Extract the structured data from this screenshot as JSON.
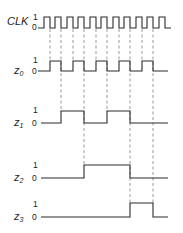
{
  "diagram": {
    "type": "timing-diagram",
    "signals": [
      {
        "name": "CLK",
        "label_main": "CLK",
        "label_sub": "",
        "level_high": "1",
        "level_low": "0"
      },
      {
        "name": "z0",
        "label_main": "z",
        "label_sub": "0",
        "level_high": "1",
        "level_low": "0"
      },
      {
        "name": "z1",
        "label_main": "z",
        "label_sub": "1",
        "level_high": "1",
        "level_low": "0"
      },
      {
        "name": "z2",
        "label_main": "z",
        "label_sub": "2",
        "level_high": "1",
        "level_low": "0"
      },
      {
        "name": "z3",
        "label_main": "z",
        "label_sub": "3",
        "level_high": "1",
        "level_low": "0"
      }
    ],
    "clock_pulses": 10,
    "waveforms": {
      "CLK": [
        1,
        0,
        1,
        0,
        1,
        0,
        1,
        0,
        1,
        0,
        1,
        0,
        1,
        0,
        1,
        0,
        1,
        0,
        1,
        0
      ],
      "z0": [
        0,
        1,
        0,
        1,
        0,
        1,
        0,
        1,
        0,
        1,
        0
      ],
      "z1": [
        0,
        0,
        1,
        1,
        0,
        0,
        1,
        1,
        0,
        0,
        0
      ],
      "z2": [
        0,
        0,
        0,
        0,
        1,
        1,
        1,
        1,
        0,
        0,
        0
      ],
      "z3": [
        0,
        0,
        0,
        0,
        0,
        0,
        0,
        0,
        1,
        1,
        0
      ]
    },
    "colors": {
      "line": "#2a2a2a",
      "guide": "#555555",
      "background": "#ffffff"
    }
  }
}
